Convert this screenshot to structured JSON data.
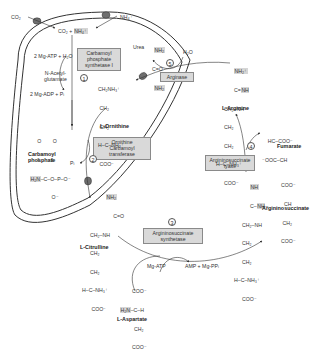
{
  "diagram": {
    "compartments": [
      "mitochondrial matrix",
      "cytosol"
    ],
    "colors": {
      "membrane": "#333333",
      "transporter": "#6e6e6e",
      "enzyme_box": "#d9d9d9",
      "highlight": "#d6d6d6",
      "arrow": "#333333"
    },
    "inputs": {
      "co2_outside": "CO₂",
      "nh4_outside": "NH₄⁺",
      "co2_nh4_inside": "CO₂ + ",
      "nh4_inside": "NH₄⁺"
    },
    "step1": {
      "number": "1",
      "enzyme": [
        "Carbamoyl",
        "phosphate",
        "synthetase I"
      ],
      "cofactor_in": "2 Mg-ATP + H₂O",
      "activator": [
        "N-Acetyl-",
        "glutamate"
      ],
      "cofactor_out": "2 Mg-ADP + Pᵢ"
    },
    "carbamoyl_phosphate": {
      "name": [
        "Carbamoyl",
        "phosphate"
      ],
      "structure": {
        "top": "     O        O",
        "dbl": "     ‖        ‖",
        "main_h2n": "H₂N",
        "main": "–C–O–P–O⁻",
        "bottom": "               O⁻"
      }
    },
    "step2": {
      "number": "2",
      "enzyme": [
        "Ornithine",
        "Carbamoyl transferase"
      ],
      "byproduct": "Pᵢ"
    },
    "ornithine": {
      "name": "L-Ornithine",
      "structure": [
        "CH₂NH₃⁺",
        "  |",
        " CH₂",
        "  |",
        " CH₂",
        "  |",
        "H–C–NH₃⁺",
        "  |",
        " COO⁻"
      ]
    },
    "citrulline": {
      "name": "L-Citrulline",
      "structure_top": "NH₂",
      "structure": [
        "      |",
        "     C=O",
        "      |",
        "CH₂–NH",
        " |",
        "CH₂",
        " |",
        "CH₂",
        " |",
        "H–C–NH₃⁺",
        " |",
        " COO⁻"
      ]
    },
    "step3": {
      "number": "3",
      "enzyme": [
        "Argininosuccinate",
        "synthetase"
      ],
      "cofactor_in": "Mg-ATP",
      "cofactor_out": "AMP + Mg-PPᵢ"
    },
    "aspartate": {
      "name": "L-Aspartate",
      "structure_h2n": "H₂N",
      "structure": [
        "     COO⁻",
        "      |",
        "   –C–H",
        "      |",
        "     CH₂",
        "      |",
        "     COO⁻"
      ]
    },
    "argininosuccinate": {
      "name": "Argininosuccinate",
      "structure_nh": "NH",
      "structure_nh2": "NH",
      "structure_left": [
        " ‖",
        " C–",
        " |",
        "CH₂–NH",
        " |",
        "CH₂",
        " |",
        "CH₂",
        " |",
        "H–C–NH₃⁺",
        " |",
        "COO⁻"
      ],
      "structure_right": [
        "COO⁻",
        "  |",
        "  CH",
        "  |",
        " CH₂",
        "  |",
        "COO⁻"
      ]
    },
    "step4": {
      "number": "4",
      "enzyme": [
        "Argininosuccinate",
        "lyase"
      ]
    },
    "fumarate": {
      "name": "Fumarate",
      "structure": [
        "    HC–COO⁻",
        "     ‖",
        "⁻OOC–CH"
      ]
    },
    "arginine": {
      "name": "L-Arginine",
      "structure_top": "NH₂⁺",
      "structure_nh": "NH",
      "structure": [
        "  C=",
        "  |",
        "CH₂–NH",
        " |",
        "CH₂",
        " |",
        "CH₂",
        " |",
        "H–C–NH₃⁺",
        " |",
        " COO⁻"
      ]
    },
    "step5": {
      "number": "5",
      "enzyme": [
        "Arginase"
      ],
      "cofactor_in": "H₂O"
    },
    "urea": {
      "name": "Urea",
      "nh2_top": "NH₂",
      "co": "C=O",
      "nh2_bottom": "NH₂"
    }
  }
}
